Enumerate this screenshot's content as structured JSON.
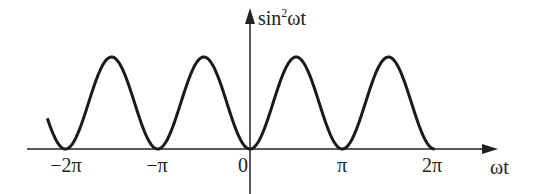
{
  "chart_data": {
    "type": "line",
    "title": "",
    "function": "sin^2(ωt)",
    "xlabel": "ωt",
    "ylabel": "sin²ωt",
    "xlim": [
      -6.9,
      7.3
    ],
    "ylim": [
      0,
      1
    ],
    "x_ticks": [
      {
        "value": -6.2832,
        "label": "−2π"
      },
      {
        "value": -3.1416,
        "label": "−π"
      },
      {
        "value": 0,
        "label": "0"
      },
      {
        "value": 3.1416,
        "label": "π"
      },
      {
        "value": 6.2832,
        "label": "2π"
      }
    ],
    "series": [
      {
        "name": "sin²ωt",
        "x_range": [
          -6.9,
          6.2832
        ],
        "peaks_at": [
          -4.712,
          -1.571,
          1.571,
          4.712
        ],
        "peak_value": 1,
        "zeros_at": [
          -6.2832,
          -3.1416,
          0,
          3.1416,
          6.2832
        ]
      }
    ],
    "grid": false,
    "legend": null
  },
  "labels": {
    "y_axis_base": "sin",
    "y_axis_sup": "2",
    "y_axis_tail": "ωt",
    "x_axis": "ωt",
    "tick_neg2pi": "−2π",
    "tick_negpi": "−π",
    "tick_zero": "0",
    "tick_pi": "π",
    "tick_2pi": "2π"
  }
}
